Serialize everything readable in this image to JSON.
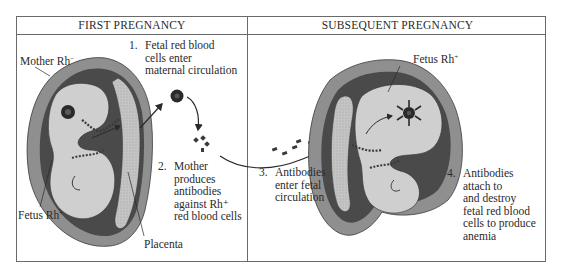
{
  "panels": {
    "first": {
      "title": "FIRST PREGNANCY"
    },
    "subsequent": {
      "title": "SUBSEQUENT PREGNANCY"
    }
  },
  "labels": {
    "mother": {
      "text": "Mother Rh",
      "sign": "−"
    },
    "fetus_first": {
      "text": "Fetus Rh",
      "sign": "+"
    },
    "placenta": {
      "text": "Placenta"
    },
    "fetus_subsequent": {
      "text": "Fetus Rh",
      "sign": "+"
    }
  },
  "steps": [
    {
      "number": "1.",
      "text": "Fetal red blood\ncells enter\nmaternal circulation"
    },
    {
      "number": "2.",
      "text": "Mother\nproduces\nantibodies\nagainst Rh⁺\nred blood cells"
    },
    {
      "number": "3.",
      "text": "Antibodies\nenter fetal\ncirculation"
    },
    {
      "number": "4.",
      "text": "Antibodies\nattach to\nand destroy\nfetal red blood\ncells to produce\nanemia"
    }
  ],
  "colors": {
    "uterus_wall": "#8f8f8f",
    "uterus_dark": "#4a4a4a",
    "fetus_fill": "#cfcfcf",
    "placenta_fill": "#b5b5b5",
    "line": "#2a2a2a",
    "frame": "#6a6a6a"
  }
}
